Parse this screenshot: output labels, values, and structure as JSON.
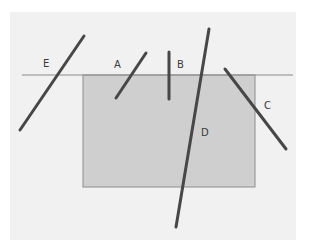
{
  "diagram": {
    "colors": {
      "page_bg": "#ffffff",
      "panel_bg": "#f1f1f1",
      "rect_fill": "#cfcfcf",
      "rect_stroke": "#8e8e8e",
      "horizon": "#8c8c8c",
      "segment": "#474747",
      "label": "#3a3a3a"
    },
    "panel": {
      "x": 10,
      "y": 12,
      "w": 286,
      "h": 228
    },
    "horizon_line": {
      "x1": 22,
      "y1": 75,
      "x2": 293,
      "y2": 75
    },
    "rectangle": {
      "x": 83,
      "y": 75,
      "w": 172,
      "h": 112
    },
    "segments": [
      {
        "label": "A",
        "x1": 116,
        "y1": 98,
        "x2": 146,
        "y2": 53,
        "lx": 114,
        "ly": 68
      },
      {
        "label": "B",
        "x1": 169,
        "y1": 52,
        "x2": 169,
        "y2": 99,
        "lx": 177,
        "ly": 68
      },
      {
        "label": "C",
        "x1": 225,
        "y1": 69,
        "x2": 286,
        "y2": 149,
        "lx": 264,
        "ly": 109
      },
      {
        "label": "D",
        "x1": 209,
        "y1": 29,
        "x2": 176,
        "y2": 227,
        "lx": 201,
        "ly": 136
      },
      {
        "label": "E",
        "x1": 20,
        "y1": 130,
        "x2": 84,
        "y2": 36,
        "lx": 43,
        "ly": 67
      }
    ]
  }
}
